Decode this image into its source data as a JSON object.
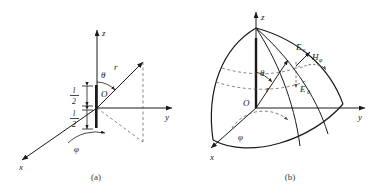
{
  "figure": {
    "width": 385,
    "height": 193,
    "background": "#ffffff",
    "line_color": "#1a1a1a",
    "dash_color": "#555555"
  },
  "panel_a": {
    "caption": "(a)",
    "axes": [
      {
        "name": "z",
        "label": "z",
        "direction": "up"
      },
      {
        "name": "y",
        "label": "y",
        "direction": "right"
      },
      {
        "name": "x",
        "label": "x",
        "direction": "lower-left"
      }
    ],
    "angles": [
      {
        "name": "theta",
        "label": "θ"
      },
      {
        "name": "phi",
        "label": "φ"
      }
    ],
    "vectors": [
      {
        "name": "r",
        "label": "r"
      }
    ],
    "origin_label": "O",
    "dipole": {
      "upper_segment": {
        "numerator": "l",
        "denominator": "2"
      },
      "lower_segment": {
        "numerator": "l",
        "denominator": "2"
      }
    }
  },
  "panel_b": {
    "caption": "(b)",
    "axes": [
      {
        "name": "z",
        "label": "z",
        "direction": "up"
      },
      {
        "name": "y",
        "label": "y",
        "direction": "right"
      },
      {
        "name": "x",
        "label": "x",
        "direction": "lower-left"
      }
    ],
    "angles": [
      {
        "name": "theta",
        "label": "θ"
      },
      {
        "name": "phi",
        "label": "φ"
      }
    ],
    "vectors": [
      {
        "name": "r",
        "label": "r"
      }
    ],
    "origin_label": "O",
    "fields": [
      {
        "name": "E_r",
        "base": "E",
        "sub": "r"
      },
      {
        "name": "E_theta",
        "base": "E",
        "sub": "θ"
      },
      {
        "name": "H_phi",
        "base": "H",
        "sub": "φ"
      }
    ]
  }
}
